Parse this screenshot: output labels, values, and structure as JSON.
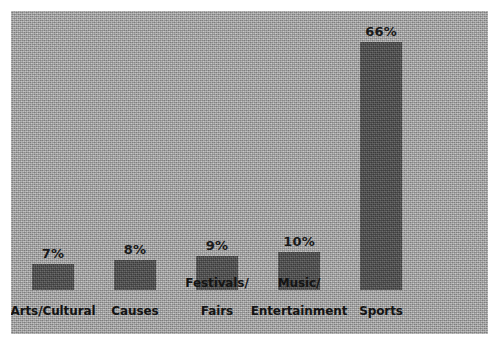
{
  "chart_data": {
    "type": "bar",
    "title": "",
    "subtitle": "",
    "xlabel": "",
    "ylabel": "",
    "ylim": [
      0,
      70
    ],
    "grid": false,
    "legend": null,
    "orientation": "vertical",
    "categories": [
      "Arts/Cultural",
      "Causes",
      "Festivals/\nFairs",
      "Music/\nEntertainment",
      "Sports"
    ],
    "values": [
      7,
      8,
      9,
      10,
      66
    ],
    "data_labels": [
      "7%",
      "8%",
      "9%",
      "10%",
      "66%"
    ],
    "value_unit": "%",
    "colors": {
      "panel_background": "#b0b0b0",
      "bar_fill": "#4c4c4c",
      "label_text": "#141414",
      "value_text": "#1a1a1a",
      "page_background": "#ffffff"
    }
  },
  "bars": [
    {
      "label": "Arts/Cultural",
      "label_line1": "Arts/Cultural",
      "label_line2": "",
      "value": 7,
      "data_label": "7%"
    },
    {
      "label": "Causes",
      "label_line1": "Causes",
      "label_line2": "",
      "value": 8,
      "data_label": "8%"
    },
    {
      "label": "Festivals/ Fairs",
      "label_line1": "Festivals/",
      "label_line2": "Fairs",
      "value": 9,
      "data_label": "9%"
    },
    {
      "label": "Music/ Entertainment",
      "label_line1": "Music/",
      "label_line2": "Entertainment",
      "value": 10,
      "data_label": "10%"
    },
    {
      "label": "Sports",
      "label_line1": "Sports",
      "label_line2": "",
      "value": 66,
      "data_label": "66%"
    }
  ]
}
